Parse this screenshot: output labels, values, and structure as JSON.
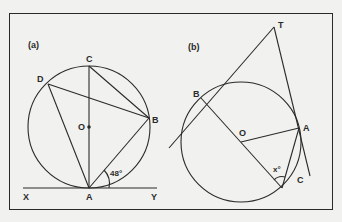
{
  "figure": {
    "background": "#f1f1ef",
    "stroke": "#2a2a2a",
    "panels": [
      {
        "id": "a",
        "label": "(a)",
        "points": {
          "C": "C",
          "D": "D",
          "O": "O",
          "B": "B",
          "A": "A",
          "X": "X",
          "Y": "Y"
        },
        "angle_label": "48°"
      },
      {
        "id": "b",
        "label": "(b)",
        "points": {
          "T": "T",
          "B": "B",
          "O": "O",
          "A": "A",
          "C": "C"
        },
        "angle_label": "x°"
      }
    ]
  }
}
